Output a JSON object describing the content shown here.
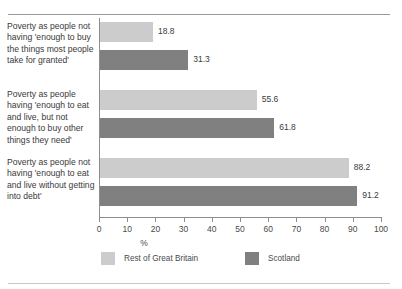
{
  "chart_data": {
    "type": "bar",
    "orientation": "horizontal",
    "title": "",
    "xlabel": "%",
    "ylabel": "",
    "xlim": [
      0,
      100
    ],
    "xticks": [
      0,
      10,
      20,
      30,
      40,
      50,
      60,
      70,
      80,
      90,
      100
    ],
    "grid": false,
    "legend_position": "bottom",
    "categories": [
      "Poverty as people not having 'enough to buy the things most people take for granted'",
      "Poverty as people having 'enough to eat and live, but not enough to buy other things they need'",
      "Poverty as people not having 'enough to eat and live without getting into debt'"
    ],
    "series": [
      {
        "name": "Rest of Great Britain",
        "color": "#cccccc",
        "values": [
          18.8,
          55.6,
          88.2
        ]
      },
      {
        "name": "Scotland",
        "color": "#808080",
        "values": [
          31.3,
          61.8,
          91.2
        ]
      }
    ],
    "value_labels": [
      [
        "18.8",
        "55.6",
        "88.2"
      ],
      [
        "31.3",
        "61.8",
        "91.2"
      ]
    ]
  },
  "axis": {
    "tick_labels": [
      "0",
      "10",
      "20",
      "30",
      "40",
      "50",
      "60",
      "70",
      "80",
      "90",
      "100"
    ],
    "unit_label": "%"
  },
  "legend": {
    "items": [
      {
        "label": "Rest of Great Britain",
        "color": "#cccccc"
      },
      {
        "label": "Scotland",
        "color": "#808080"
      }
    ]
  }
}
